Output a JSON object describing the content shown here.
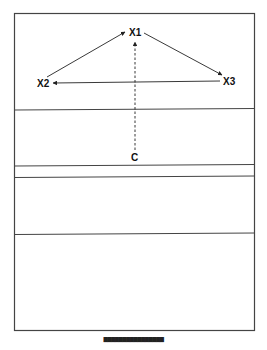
{
  "diagram": {
    "nodes": [
      {
        "id": "X1",
        "label": "X1"
      },
      {
        "id": "X2",
        "label": "X2"
      },
      {
        "id": "X3",
        "label": "X3"
      },
      {
        "id": "C",
        "label": "C"
      }
    ],
    "edges": [
      {
        "from": "X2",
        "to": "X1",
        "style": "solid"
      },
      {
        "from": "X1",
        "to": "X3",
        "style": "solid"
      },
      {
        "from": "X3",
        "to": "X2",
        "style": "solid"
      },
      {
        "from": "C",
        "to": "X1",
        "style": "dashed"
      }
    ],
    "panels": 5,
    "line_color": "#333333",
    "text_color": "#111111"
  },
  "caption": {
    "text": "████████████████"
  }
}
